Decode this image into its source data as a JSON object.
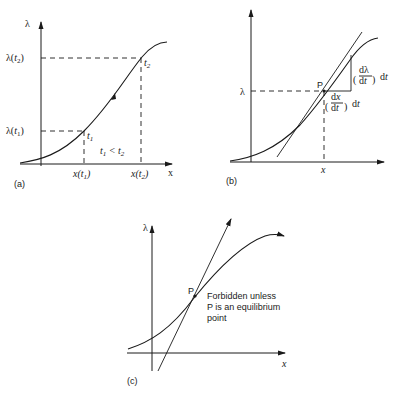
{
  "figure": {
    "panels": [
      {
        "id": "a",
        "caption": "(a)",
        "y_axis_label": "λ",
        "x_axis_label": "x",
        "y_ticks": [
          "λ(t1)",
          "λ(t2)"
        ],
        "x_ticks": [
          "x(t1)",
          "x(t2)"
        ],
        "point_labels": [
          "t1",
          "t2"
        ],
        "annotation": "t1 < t2",
        "curve_direction_arrow": true
      },
      {
        "id": "b",
        "caption": "(b)",
        "y_axis_label": "λ",
        "x_axis_label": "x",
        "point_label": "P",
        "tangent_line": true,
        "increment_labels": {
          "vertical": "(dλ/dt) dt",
          "horizontal": "(dx/dt) dt"
        }
      },
      {
        "id": "c",
        "caption": "(c)",
        "y_axis_label": "λ",
        "x_axis_label": "x",
        "point_label": "P",
        "annotation_lines": [
          "Forbidden unless",
          "P is an equilibrium",
          "point"
        ]
      }
    ]
  },
  "colors": {
    "ink": "#1a1a1a",
    "background": "#ffffff"
  }
}
